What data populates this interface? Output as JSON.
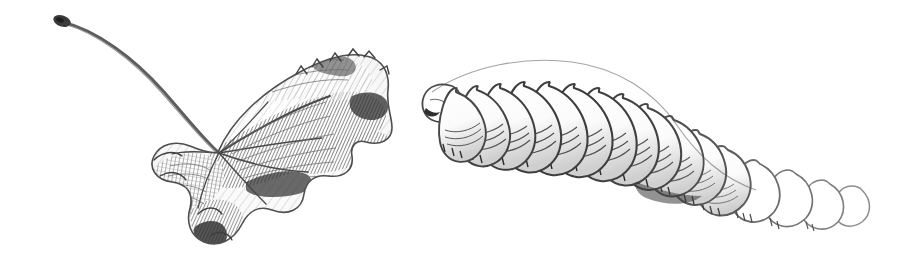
{
  "plate": {
    "background_color": "#ffffff",
    "ink_color": "#3a3a3a",
    "mid_tone_color": "#7d7d7d",
    "light_tone_color": "#b4b4b4",
    "width": 908,
    "height": 262,
    "medium": "pencil / pen-and-ink hatched drawing",
    "title": ""
  },
  "figures": [
    {
      "id": "leaf",
      "name": "withered-leaf",
      "label": "",
      "description": "Dried curled leaf with long arching stem, heavy parallel hatching along veins",
      "bounds": {
        "x": 55,
        "y": 10,
        "width": 345,
        "height": 238
      },
      "stem": {
        "tip": {
          "x": 60,
          "y": 20
        },
        "base": {
          "x": 218,
          "y": 152
        },
        "tip_is_bulbous": true
      },
      "blade": {
        "lobes": 5,
        "tip": {
          "x": 392,
          "y": 128
        }
      }
    },
    {
      "id": "larva",
      "name": "fly-larva",
      "label": "",
      "description": "Segmented maggot / fly larva, head at upper-left, tapering tail to lower-right, bristle spines along ventral edge",
      "bounds": {
        "x": 420,
        "y": 48,
        "width": 452,
        "height": 186
      },
      "head": {
        "x": 428,
        "y": 102
      },
      "tail": {
        "x": 868,
        "y": 215
      },
      "segment_count": 15,
      "segments": [
        {
          "index": 1,
          "cx": 449,
          "cy": 104,
          "rx": 19,
          "ry": 27,
          "rot": -26,
          "shade": "dark"
        },
        {
          "index": 2,
          "cx": 470,
          "cy": 100,
          "rx": 21,
          "ry": 30,
          "rot": -24,
          "shade": "dark"
        },
        {
          "index": 3,
          "cx": 494,
          "cy": 97,
          "rx": 23,
          "ry": 33,
          "rot": -22,
          "shade": "dark"
        },
        {
          "index": 4,
          "cx": 520,
          "cy": 95,
          "rx": 24,
          "ry": 36,
          "rot": -18,
          "shade": "dark"
        },
        {
          "index": 5,
          "cx": 548,
          "cy": 96,
          "rx": 25,
          "ry": 38,
          "rot": -14,
          "shade": "dark"
        },
        {
          "index": 6,
          "cx": 576,
          "cy": 100,
          "rx": 26,
          "ry": 40,
          "rot": -8,
          "shade": "dark"
        },
        {
          "index": 7,
          "cx": 604,
          "cy": 107,
          "rx": 26,
          "ry": 41,
          "rot": -2,
          "shade": "dark"
        },
        {
          "index": 8,
          "cx": 632,
          "cy": 117,
          "rx": 26,
          "ry": 41,
          "rot": 6,
          "shade": "dark"
        },
        {
          "index": 9,
          "cx": 659,
          "cy": 130,
          "rx": 26,
          "ry": 40,
          "rot": 14,
          "shade": "medium"
        },
        {
          "index": 10,
          "cx": 686,
          "cy": 145,
          "rx": 25,
          "ry": 38,
          "rot": 22,
          "shade": "medium"
        },
        {
          "index": 11,
          "cx": 712,
          "cy": 161,
          "rx": 24,
          "ry": 36,
          "rot": 28,
          "shade": "medium"
        },
        {
          "index": 12,
          "cx": 737,
          "cy": 176,
          "rx": 23,
          "ry": 33,
          "rot": 33,
          "shade": "light"
        },
        {
          "index": 13,
          "cx": 772,
          "cy": 188,
          "rx": 23,
          "ry": 31,
          "rot": 38,
          "shade": "light"
        },
        {
          "index": 14,
          "cx": 806,
          "cy": 198,
          "rx": 22,
          "ry": 28,
          "rot": 42,
          "shade": "light"
        },
        {
          "index": 15,
          "cx": 840,
          "cy": 206,
          "rx": 21,
          "ry": 25,
          "rot": 46,
          "shade": "light"
        }
      ]
    }
  ]
}
